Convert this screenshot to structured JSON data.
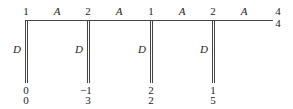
{
  "diagram": {
    "nodes": [
      {
        "x": 25,
        "top": "1",
        "bottom1": "0",
        "bottom2": "0"
      },
      {
        "x": 87,
        "top": "2",
        "bottom1": "−1",
        "bottom2": "3"
      },
      {
        "x": 150,
        "top": "1",
        "bottom1": "2",
        "bottom2": "2"
      },
      {
        "x": 212,
        "top": "2",
        "bottom1": "1",
        "bottom2": "5"
      }
    ],
    "edge_label": "A",
    "branch_label": "D",
    "end": {
      "top": "4",
      "bottom": "4"
    }
  }
}
